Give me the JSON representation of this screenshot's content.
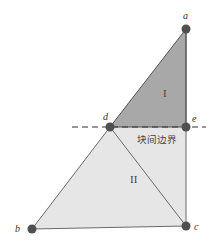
{
  "diagram": {
    "points": {
      "a": {
        "label": "a",
        "x": 186,
        "y": 29
      },
      "d": {
        "label": "d",
        "x": 110,
        "y": 127
      },
      "e": {
        "label": "e",
        "x": 186,
        "y": 127
      },
      "b": {
        "label": "b",
        "x": 32,
        "y": 229
      },
      "c": {
        "label": "c",
        "x": 186,
        "y": 226
      }
    },
    "regions": {
      "one": {
        "label": "I",
        "color": "#a9a9a9"
      },
      "two": {
        "label": "II",
        "color": "#e4e4e4"
      }
    },
    "boundary_label": "块间边界",
    "colors": {
      "vertex": "#505050",
      "edge": "#6a6a6a",
      "dash": "#333333"
    }
  }
}
